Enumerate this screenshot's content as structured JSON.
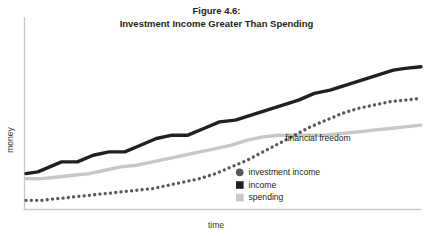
{
  "figure": {
    "title_lines": [
      "Figure 4.6:",
      "Investment Income Greater Than Spending"
    ],
    "background": "#ffffff"
  },
  "annotations": [
    {
      "id": "financial-freedom",
      "text": "financial freedom",
      "x": 318,
      "y": 141
    }
  ],
  "legend": {
    "position": "inside-bottom-center",
    "items": [
      {
        "key": "investment_income",
        "label": "investment income",
        "marker": "circle",
        "color": "#58595b"
      },
      {
        "key": "income",
        "label": "income",
        "marker": "square",
        "color": "#231f20"
      },
      {
        "key": "spending",
        "label": "spending",
        "marker": "square",
        "color": "#c6c7c9"
      }
    ]
  },
  "chart_data": {
    "type": "line",
    "title": "Figure 4.6: Investment Income Greater Than Spending",
    "xlabel": "time",
    "ylabel": "money",
    "grid": false,
    "xlim": [
      0,
      100
    ],
    "ylim": [
      0,
      100
    ],
    "axis_ticks": {
      "x": [],
      "y": []
    },
    "annotation_note": "financial freedom occurs where investment income crosses above spending",
    "series": [
      {
        "name": "income",
        "color": "#231f20",
        "style": "solid",
        "width": 3.4,
        "x": [
          0,
          3,
          6,
          9,
          13,
          17,
          21,
          25,
          29,
          33,
          37,
          41,
          45,
          49,
          53,
          57,
          61,
          65,
          69,
          73,
          77,
          81,
          85,
          89,
          93,
          96,
          100
        ],
        "y": [
          20,
          21,
          24,
          27,
          27,
          31,
          33,
          33,
          37,
          41,
          43,
          43,
          47,
          51,
          52,
          55,
          58,
          61,
          64,
          68,
          70,
          73,
          76,
          79,
          82,
          83,
          84
        ]
      },
      {
        "name": "spending",
        "color": "#c6c7c9",
        "style": "solid",
        "width": 3.4,
        "x": [
          0,
          4,
          8,
          12,
          16,
          20,
          24,
          28,
          32,
          36,
          40,
          44,
          48,
          52,
          56,
          60,
          64,
          68,
          72,
          76,
          80,
          84,
          88,
          92,
          96,
          100
        ],
        "y": [
          17,
          17,
          18,
          19,
          20,
          22,
          24,
          25,
          27,
          29,
          31,
          33,
          35,
          37,
          40,
          42,
          43,
          43,
          43,
          43,
          44,
          45,
          46,
          47,
          48,
          49
        ]
      },
      {
        "name": "investment income",
        "color": "#58595b",
        "style": "dotted",
        "width": 3.3,
        "x": [
          0,
          4,
          8,
          12,
          16,
          20,
          24,
          28,
          32,
          36,
          40,
          44,
          48,
          52,
          56,
          60,
          64,
          68,
          72,
          76,
          80,
          84,
          88,
          92,
          96,
          100
        ],
        "y": [
          4,
          4,
          5,
          6,
          7,
          8,
          9,
          10,
          11,
          13,
          15,
          17,
          20,
          24,
          28,
          33,
          38,
          43,
          48,
          52,
          56,
          59,
          61,
          63,
          64,
          65
        ]
      }
    ]
  }
}
